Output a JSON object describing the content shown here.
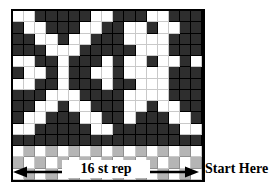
{
  "chart_data": {
    "type": "heatmap",
    "title": "",
    "xlabel": "16 st rep",
    "ylabel": "",
    "grid": true,
    "legend_position": "none",
    "columns": 17,
    "rows": 13,
    "colors": {
      "dark": "#2e2e2e",
      "light": "#ffffff",
      "gray": "#b5b5b5",
      "border": "#000000",
      "gridline": "#2b2b2b"
    },
    "legend_entries": [
      {
        "key": "dark",
        "label": "main color (dark)"
      },
      {
        "key": "light",
        "label": "contrast color (white)"
      },
      {
        "key": "gray",
        "label": "ribbing color (gray)"
      }
    ],
    "tick_labels": {
      "x": [],
      "y": []
    },
    "axis_ranges": {
      "x": [
        0,
        17
      ],
      "y": [
        0,
        13
      ]
    },
    "cells": [
      [
        "light",
        "light",
        "dark",
        "dark",
        "dark",
        "dark",
        "dark",
        "light",
        "light",
        "dark",
        "dark",
        "dark",
        "light",
        "light",
        "dark",
        "dark",
        "dark"
      ],
      [
        "dark",
        "light",
        "light",
        "dark",
        "dark",
        "dark",
        "light",
        "light",
        "dark",
        "dark",
        "light",
        "light",
        "dark",
        "light",
        "light",
        "dark",
        "dark"
      ],
      [
        "dark",
        "dark",
        "light",
        "light",
        "dark",
        "light",
        "light",
        "dark",
        "dark",
        "dark",
        "light",
        "light",
        "light",
        "light",
        "dark",
        "dark",
        "dark"
      ],
      [
        "dark",
        "dark",
        "dark",
        "light",
        "light",
        "light",
        "dark",
        "dark",
        "dark",
        "dark",
        "dark",
        "light",
        "light",
        "light",
        "dark",
        "dark",
        "dark"
      ],
      [
        "light",
        "light",
        "dark",
        "dark",
        "light",
        "dark",
        "dark",
        "dark",
        "light",
        "dark",
        "light",
        "light",
        "dark",
        "light",
        "light",
        "dark",
        "light"
      ],
      [
        "dark",
        "light",
        "light",
        "dark",
        "light",
        "dark",
        "dark",
        "light",
        "light",
        "dark",
        "light",
        "light",
        "light",
        "light",
        "dark",
        "dark",
        "dark"
      ],
      [
        "light",
        "light",
        "dark",
        "dark",
        "light",
        "dark",
        "dark",
        "dark",
        "light",
        "dark",
        "dark",
        "light",
        "light",
        "light",
        "dark",
        "dark",
        "dark"
      ],
      [
        "dark",
        "dark",
        "dark",
        "light",
        "light",
        "light",
        "dark",
        "dark",
        "dark",
        "dark",
        "light",
        "light",
        "light",
        "light",
        "dark",
        "dark",
        "dark"
      ],
      [
        "dark",
        "dark",
        "light",
        "light",
        "dark",
        "light",
        "light",
        "dark",
        "dark",
        "dark",
        "light",
        "light",
        "dark",
        "light",
        "light",
        "dark",
        "dark"
      ],
      [
        "dark",
        "light",
        "light",
        "dark",
        "dark",
        "dark",
        "light",
        "light",
        "dark",
        "dark",
        "light",
        "dark",
        "dark",
        "dark",
        "light",
        "light",
        "dark"
      ],
      [
        "light",
        "light",
        "dark",
        "dark",
        "dark",
        "dark",
        "dark",
        "light",
        "light",
        "dark",
        "dark",
        "dark",
        "dark",
        "dark",
        "dark",
        "light",
        "light"
      ],
      [
        "dark",
        "dark",
        "dark",
        "dark",
        "dark",
        "dark",
        "dark",
        "dark",
        "dark",
        "dark",
        "dark",
        "dark",
        "dark",
        "dark",
        "dark",
        "dark",
        "dark"
      ],
      [
        "light",
        "gray",
        "light",
        "gray",
        "light",
        "gray",
        "light",
        "gray",
        "light",
        "gray",
        "light",
        "gray",
        "light",
        "gray",
        "light",
        "gray",
        "light"
      ],
      [
        "gray",
        "light",
        "gray",
        "light",
        "gray",
        "light",
        "gray",
        "light",
        "gray",
        "light",
        "gray",
        "light",
        "gray",
        "light",
        "gray",
        "light",
        "gray"
      ],
      [
        "light",
        "gray",
        "light",
        "gray",
        "light",
        "gray",
        "light",
        "gray",
        "light",
        "gray",
        "light",
        "gray",
        "light",
        "gray",
        "light",
        "gray",
        "light"
      ]
    ]
  },
  "caption": {
    "rep_label": "16 st rep",
    "start_label": "Start Here"
  }
}
